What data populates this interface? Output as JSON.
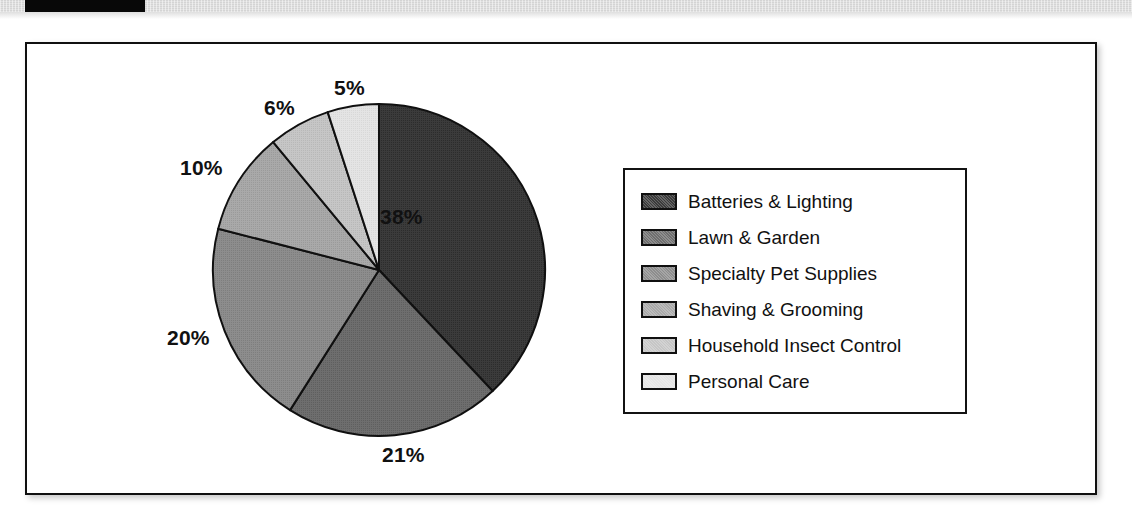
{
  "header": {
    "redaction_bar": "",
    "band_color": "#d4d4d4"
  },
  "chart_data": {
    "type": "pie",
    "title": "",
    "legend_position": "right",
    "start_angle_deg": 0,
    "direction": "clockwise",
    "categories": [
      "Batteries & Lighting",
      "Lawn & Garden",
      "Specialty Pet Supplies",
      "Shaving & Grooming",
      "Household Insect Control",
      "Personal Care"
    ],
    "values": [
      38,
      21,
      20,
      10,
      6,
      5
    ],
    "value_labels": [
      "38%",
      "21%",
      "20%",
      "10%",
      "6%",
      "5%"
    ],
    "colors": [
      "#3b3b3b",
      "#6e6e6e",
      "#8d8d8d",
      "#a9a9a9",
      "#c6c6c6",
      "#e4e4e4"
    ],
    "slice_border_color": "#101010",
    "units": "percent"
  },
  "labels": {
    "p38": "38%",
    "p21": "21%",
    "p20": "20%",
    "p10": "10%",
    "p6": "6%",
    "p5": "5%"
  },
  "legend": {
    "items": [
      {
        "label": "Batteries & Lighting",
        "color": "#3b3b3b"
      },
      {
        "label": "Lawn & Garden",
        "color": "#6e6e6e"
      },
      {
        "label": "Specialty Pet Supplies",
        "color": "#8d8d8d"
      },
      {
        "label": "Shaving & Grooming",
        "color": "#a9a9a9"
      },
      {
        "label": "Household Insect Control",
        "color": "#c6c6c6"
      },
      {
        "label": "Personal Care",
        "color": "#e4e4e4"
      }
    ]
  }
}
